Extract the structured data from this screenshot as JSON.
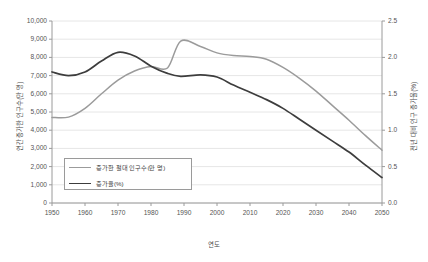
{
  "chart_data": {
    "type": "line",
    "title": "",
    "xlabel": "연도",
    "ylabel": "연간 증가한 인구수(만 명)",
    "ylabel_right": "전년 대비 인구 증가율(%)",
    "xlim": [
      1950,
      2050
    ],
    "ylim": [
      0,
      10000
    ],
    "ylim_right": [
      0.0,
      2.5
    ],
    "grid": true,
    "legend_position": "inside-lower-left",
    "xticks": [
      "1950",
      "1960",
      "1970",
      "1980",
      "1990",
      "2000",
      "2010",
      "2020",
      "2030",
      "2040",
      "2050"
    ],
    "yticks_left": [
      "0",
      "1,000",
      "2,000",
      "3,000",
      "4,000",
      "5,000",
      "6,000",
      "7,000",
      "8,000",
      "9,000",
      "10,000"
    ],
    "yticks_right": [
      "0.0",
      "0.5",
      "1.0",
      "1.5",
      "2.0",
      "2.5"
    ],
    "x": [
      1950,
      1955,
      1960,
      1965,
      1970,
      1975,
      1980,
      1985,
      1989,
      1995,
      2000,
      2005,
      2010,
      2015,
      2020,
      2025,
      2030,
      2035,
      2040,
      2045,
      2050
    ],
    "series": [
      {
        "name": "증가한 절대 인구수(만 명)",
        "axis": "left",
        "color": "#9b9b9b",
        "values": [
          4700,
          4720,
          5200,
          6000,
          6750,
          7250,
          7500,
          7420,
          8900,
          8600,
          8250,
          8100,
          8050,
          7900,
          7450,
          6850,
          6150,
          5350,
          4550,
          3700,
          2900
        ]
      },
      {
        "name": "증가율(%)",
        "axis": "right",
        "color": "#3d3d3d",
        "values": [
          1.8,
          1.75,
          1.8,
          1.95,
          2.07,
          2.02,
          1.88,
          1.78,
          1.74,
          1.76,
          1.73,
          1.62,
          1.52,
          1.42,
          1.3,
          1.15,
          1.0,
          0.85,
          0.7,
          0.52,
          0.35
        ]
      }
    ]
  },
  "legend": {
    "items": [
      {
        "label": "증가한 절대 인구수(만 명)",
        "color": "#9b9b9b"
      },
      {
        "label": "증가율(%)",
        "color": "#3d3d3d"
      }
    ]
  }
}
